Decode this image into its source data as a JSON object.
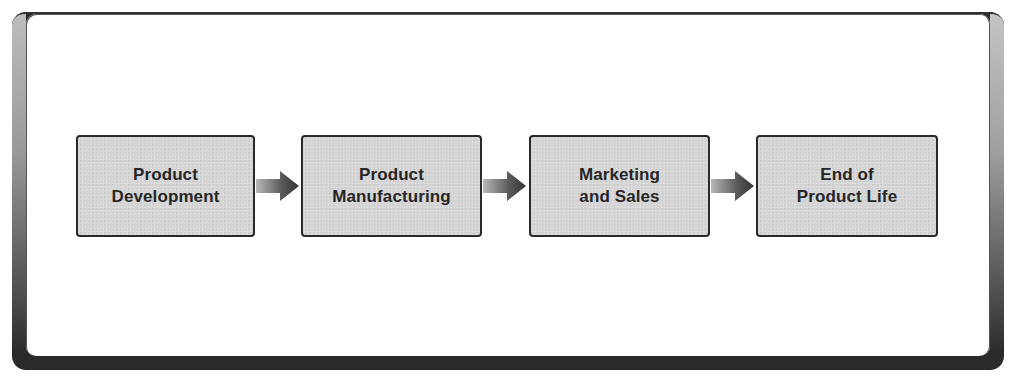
{
  "diagram": {
    "type": "flowchart",
    "direction": "left-to-right",
    "stages": [
      {
        "label": "Product\nDevelopment"
      },
      {
        "label": "Product\nManufacturing"
      },
      {
        "label": "Marketing\nand Sales"
      },
      {
        "label": "End of\nProduct Life"
      }
    ],
    "connectors": [
      {
        "from": 0,
        "to": 1,
        "icon": "arrow-right-icon"
      },
      {
        "from": 1,
        "to": 2,
        "icon": "arrow-right-icon"
      },
      {
        "from": 2,
        "to": 3,
        "icon": "arrow-right-icon"
      }
    ],
    "colors": {
      "stage_fill": "#d6d6d6",
      "stage_border": "#2a2a2a",
      "text": "#262626",
      "frame_dark": "#2a2a2a",
      "arrow_dark": "#3a3a3a",
      "arrow_light": "#b0b0b0"
    }
  }
}
